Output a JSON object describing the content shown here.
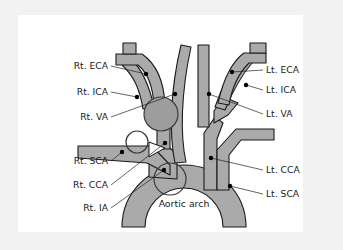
{
  "figure": {
    "background_color": "#f2f2f2",
    "panel_color": "#ffffff",
    "vessel_fill": "#aaaaaa",
    "vessel_stroke": "#1a1a1a",
    "marker_dot_color": "#000000",
    "central_label": "Aortic arch"
  },
  "labels_left": [
    {
      "id": "rt-eca",
      "text": "Rt. ECA",
      "x": 90,
      "y": 54
    },
    {
      "id": "rt-ica",
      "text": "Rt. ICA",
      "x": 90,
      "y": 80
    },
    {
      "id": "rt-va",
      "text": "Rt. VA",
      "x": 90,
      "y": 105
    },
    {
      "id": "rt-sca",
      "text": "Rt. SCA",
      "x": 90,
      "y": 149
    },
    {
      "id": "rt-cca",
      "text": "Rt. CCA",
      "x": 90,
      "y": 173
    },
    {
      "id": "rt-ia",
      "text": "Rt. IA",
      "x": 90,
      "y": 196
    }
  ],
  "labels_right": [
    {
      "id": "lt-eca",
      "text": "Lt. ECA",
      "x": 248,
      "y": 58
    },
    {
      "id": "lt-ica",
      "text": "Lt. ICA",
      "x": 248,
      "y": 78
    },
    {
      "id": "lt-va",
      "text": "Lt. VA",
      "x": 248,
      "y": 102
    },
    {
      "id": "lt-cca",
      "text": "Lt. CCA",
      "x": 248,
      "y": 158
    },
    {
      "id": "lt-sca",
      "text": "Lt. SCA",
      "x": 248,
      "y": 182
    }
  ],
  "anchor_dots": [
    {
      "for": "rt-eca",
      "x": 128,
      "y": 59
    },
    {
      "for": "rt-ica",
      "x": 119,
      "y": 82
    },
    {
      "for": "rt-va",
      "x": 157,
      "y": 79
    },
    {
      "for": "rt-sca",
      "x": 104,
      "y": 137
    },
    {
      "for": "rt-cca",
      "x": 147,
      "y": 128
    },
    {
      "for": "rt-ia",
      "x": 146,
      "y": 155
    },
    {
      "for": "lt-eca",
      "x": 214,
      "y": 57
    },
    {
      "for": "lt-ica",
      "x": 228,
      "y": 70
    },
    {
      "for": "lt-va",
      "x": 191,
      "y": 79
    },
    {
      "for": "lt-cca",
      "x": 193,
      "y": 143
    },
    {
      "for": "lt-sca",
      "x": 212,
      "y": 171
    }
  ],
  "abbreviation_key": {
    "ECA": "External carotid artery",
    "ICA": "Internal carotid artery",
    "VA": "Vertebral artery",
    "SCA": "Subclavian artery",
    "CCA": "Common carotid artery",
    "IA": "Innominate artery"
  }
}
